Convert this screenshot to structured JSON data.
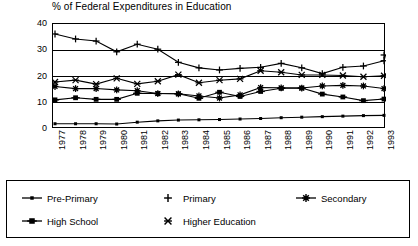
{
  "chart_data": {
    "type": "line",
    "title": "% of Federal Expenditures in Education",
    "xlabel": "",
    "ylabel": "",
    "ylim": [
      0,
      40
    ],
    "yticks": [
      0,
      10,
      20,
      30,
      40
    ],
    "grid": true,
    "legend_position": "bottom",
    "categories": [
      "1977",
      "1978",
      "1979",
      "1980",
      "1981",
      "1982",
      "1983",
      "1984",
      "1985",
      "1986",
      "1987",
      "1988",
      "1989",
      "1990",
      "1991",
      "1992",
      "1993"
    ],
    "series": [
      {
        "name": "Pre-Primary",
        "marker": "small-square",
        "values": [
          2.0,
          2.0,
          2.0,
          1.9,
          2.6,
          3.1,
          3.4,
          3.5,
          3.6,
          3.8,
          4.0,
          4.3,
          4.5,
          4.7,
          4.9,
          5.1,
          5.2
        ]
      },
      {
        "name": "Primary",
        "marker": "plus",
        "values": [
          36.2,
          34.3,
          33.5,
          29.4,
          32.3,
          30.4,
          25.4,
          23.3,
          22.5,
          23.1,
          23.5,
          25.0,
          23.3,
          21.1,
          23.5,
          24.0,
          26.0
        ]
      },
      {
        "name": "Secondary",
        "marker": "asterisk",
        "values": [
          16.2,
          15.4,
          15.4,
          14.9,
          14.6,
          13.5,
          13.4,
          12.6,
          11.8,
          13.0,
          15.8,
          15.7,
          15.6,
          16.4,
          16.6,
          16.4,
          15.4
        ]
      },
      {
        "name": "High School",
        "marker": "square",
        "values": [
          11.1,
          11.9,
          11.3,
          11.3,
          13.6,
          13.5,
          13.4,
          11.7,
          14.0,
          12.4,
          14.3,
          15.5,
          15.6,
          13.3,
          12.2,
          10.8,
          11.4
        ]
      },
      {
        "name": "Higher Education",
        "marker": "x-star",
        "values": [
          17.9,
          18.6,
          17.1,
          19.3,
          17.2,
          18.2,
          20.7,
          17.6,
          18.6,
          19.1,
          22.2,
          21.6,
          20.6,
          20.6,
          20.4,
          19.9,
          20.3
        ]
      }
    ],
    "last_year_extra": {
      "Primary": 28.2
    }
  },
  "legend": {
    "items": [
      {
        "label": "Pre-Primary",
        "marker": "small-square"
      },
      {
        "label": "Primary",
        "marker": "plus"
      },
      {
        "label": "Secondary",
        "marker": "asterisk"
      },
      {
        "label": "High School",
        "marker": "square"
      },
      {
        "label": "Higher Education",
        "marker": "x-star"
      }
    ]
  }
}
